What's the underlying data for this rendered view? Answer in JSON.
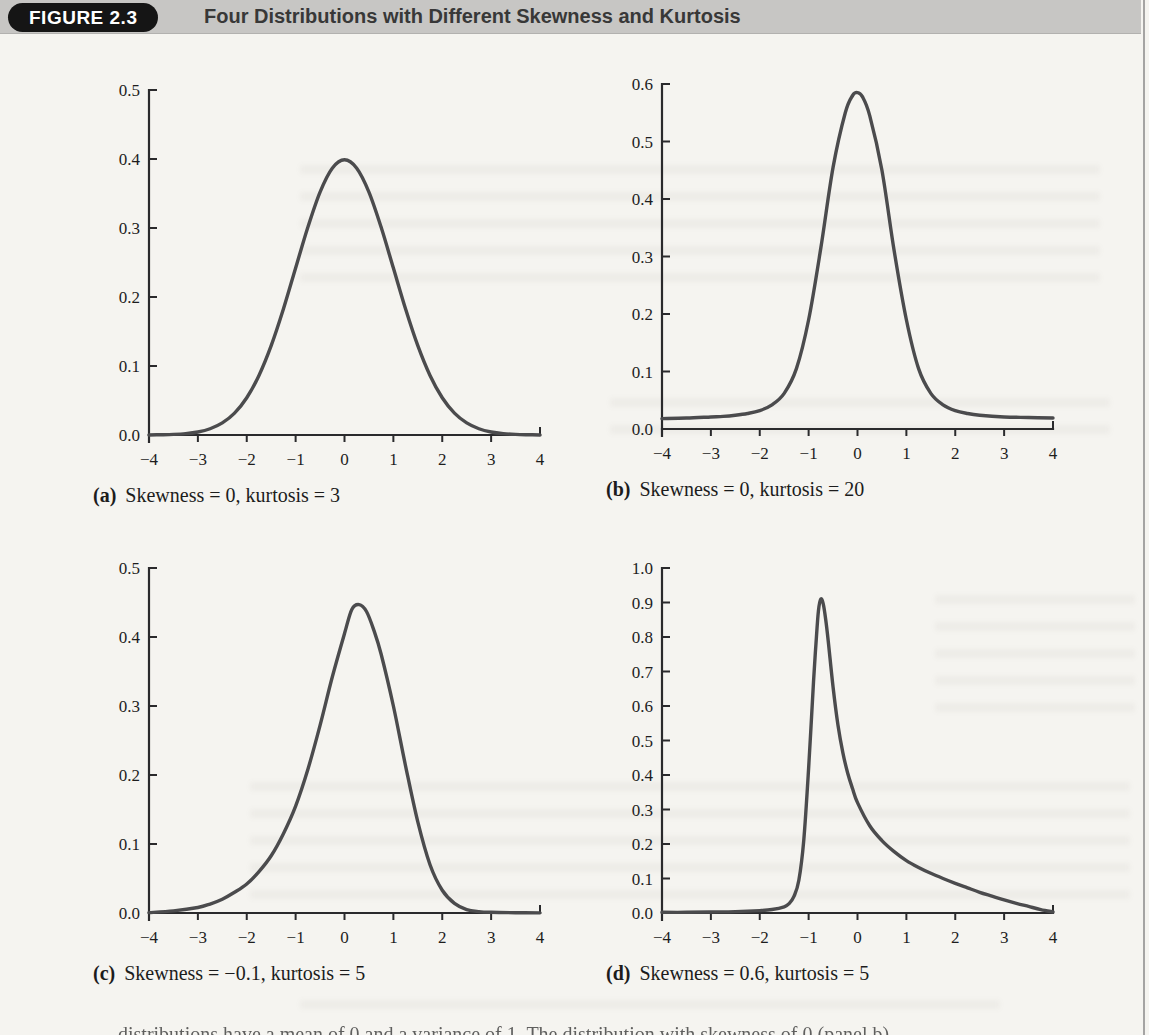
{
  "page": {
    "background": "#f5f4f0"
  },
  "header": {
    "badge": "FIGURE 2.3",
    "title": "Four Distributions with Different Skewness and Kurtosis",
    "bar_color": "#c7c6c4",
    "badge_bg": "#151515",
    "badge_text_color": "#ffffff",
    "title_color": "#383838"
  },
  "axis_color": "#2a2a2c",
  "chart_data": [
    {
      "panel": "a",
      "type": "line",
      "caption_label": "(a)",
      "caption_text": "Skewness = 0, kurtosis = 3",
      "xlim": [
        -4,
        4
      ],
      "ylim": [
        0,
        0.5
      ],
      "grid": false,
      "legend": "none",
      "curve_color": "#4b4b4d",
      "xticks": [
        {
          "v": -4,
          "label": "−4"
        },
        {
          "v": -3,
          "label": "−3"
        },
        {
          "v": -2,
          "label": "−2"
        },
        {
          "v": -1,
          "label": "−1"
        },
        {
          "v": 0,
          "label": "0"
        },
        {
          "v": 1,
          "label": "1"
        },
        {
          "v": 2,
          "label": "2"
        },
        {
          "v": 3,
          "label": "3"
        },
        {
          "v": 4,
          "label": "4"
        }
      ],
      "yticks": [
        {
          "v": 0,
          "label": "0.0"
        },
        {
          "v": 0.1,
          "label": "0.1"
        },
        {
          "v": 0.2,
          "label": "0.2"
        },
        {
          "v": 0.3,
          "label": "0.3"
        },
        {
          "v": 0.4,
          "label": "0.4"
        },
        {
          "v": 0.5,
          "label": "0.5"
        }
      ],
      "points": [
        [
          -4,
          0.0001
        ],
        [
          -3.75,
          0.0004
        ],
        [
          -3.5,
          0.0009
        ],
        [
          -3.25,
          0.002
        ],
        [
          -3,
          0.0044
        ],
        [
          -2.75,
          0.0091
        ],
        [
          -2.5,
          0.0175
        ],
        [
          -2.25,
          0.0317
        ],
        [
          -2,
          0.054
        ],
        [
          -1.75,
          0.0863
        ],
        [
          -1.5,
          0.1295
        ],
        [
          -1.25,
          0.1826
        ],
        [
          -1,
          0.242
        ],
        [
          -0.75,
          0.3011
        ],
        [
          -0.5,
          0.3521
        ],
        [
          -0.25,
          0.3867
        ],
        [
          0,
          0.3989
        ],
        [
          0.25,
          0.3867
        ],
        [
          0.5,
          0.3521
        ],
        [
          0.75,
          0.3011
        ],
        [
          1,
          0.242
        ],
        [
          1.25,
          0.1826
        ],
        [
          1.5,
          0.1295
        ],
        [
          1.75,
          0.0863
        ],
        [
          2,
          0.054
        ],
        [
          2.25,
          0.0317
        ],
        [
          2.5,
          0.0175
        ],
        [
          2.75,
          0.0091
        ],
        [
          3,
          0.0044
        ],
        [
          3.25,
          0.002
        ],
        [
          3.5,
          0.0009
        ],
        [
          3.75,
          0.0004
        ],
        [
          4,
          0.0001
        ]
      ]
    },
    {
      "panel": "b",
      "type": "line",
      "caption_label": "(b)",
      "caption_text": "Skewness = 0, kurtosis = 20",
      "xlim": [
        -4,
        4
      ],
      "ylim": [
        0,
        0.6
      ],
      "grid": false,
      "legend": "none",
      "curve_color": "#4b4b4d",
      "xticks": [
        {
          "v": -4,
          "label": "−4"
        },
        {
          "v": -3,
          "label": "−3"
        },
        {
          "v": -2,
          "label": "−2"
        },
        {
          "v": -1,
          "label": "−1"
        },
        {
          "v": 0,
          "label": "0"
        },
        {
          "v": 1,
          "label": "1"
        },
        {
          "v": 2,
          "label": "2"
        },
        {
          "v": 3,
          "label": "3"
        },
        {
          "v": 4,
          "label": "4"
        }
      ],
      "yticks": [
        {
          "v": 0,
          "label": "0.0"
        },
        {
          "v": 0.1,
          "label": "0.1"
        },
        {
          "v": 0.2,
          "label": "0.2"
        },
        {
          "v": 0.3,
          "label": "0.3"
        },
        {
          "v": 0.4,
          "label": "0.4"
        },
        {
          "v": 0.5,
          "label": "0.5"
        },
        {
          "v": 0.6,
          "label": "0.6"
        }
      ],
      "points": [
        [
          -4,
          0.018
        ],
        [
          -3.5,
          0.019
        ],
        [
          -3,
          0.021
        ],
        [
          -2.75,
          0.022
        ],
        [
          -2.5,
          0.024
        ],
        [
          -2.25,
          0.027
        ],
        [
          -2,
          0.032
        ],
        [
          -1.75,
          0.042
        ],
        [
          -1.5,
          0.062
        ],
        [
          -1.25,
          0.105
        ],
        [
          -1,
          0.19
        ],
        [
          -0.75,
          0.315
        ],
        [
          -0.5,
          0.455
        ],
        [
          -0.25,
          0.55
        ],
        [
          -0.1,
          0.58
        ],
        [
          0,
          0.585
        ],
        [
          0.1,
          0.578
        ],
        [
          0.25,
          0.545
        ],
        [
          0.5,
          0.45
        ],
        [
          0.75,
          0.31
        ],
        [
          1,
          0.19
        ],
        [
          1.25,
          0.105
        ],
        [
          1.5,
          0.062
        ],
        [
          1.75,
          0.042
        ],
        [
          2,
          0.032
        ],
        [
          2.25,
          0.027
        ],
        [
          2.5,
          0.024
        ],
        [
          3,
          0.021
        ],
        [
          3.5,
          0.02
        ],
        [
          4,
          0.019
        ]
      ]
    },
    {
      "panel": "c",
      "type": "line",
      "caption_label": "(c)",
      "caption_text": "Skewness = −0.1, kurtosis = 5",
      "xlim": [
        -4,
        4
      ],
      "ylim": [
        0,
        0.5
      ],
      "grid": false,
      "legend": "none",
      "curve_color": "#4b4b4d",
      "xticks": [
        {
          "v": -4,
          "label": "−4"
        },
        {
          "v": -3,
          "label": "−3"
        },
        {
          "v": -2,
          "label": "−2"
        },
        {
          "v": -1,
          "label": "−1"
        },
        {
          "v": 0,
          "label": "0"
        },
        {
          "v": 1,
          "label": "1"
        },
        {
          "v": 2,
          "label": "2"
        },
        {
          "v": 3,
          "label": "3"
        },
        {
          "v": 4,
          "label": "4"
        }
      ],
      "yticks": [
        {
          "v": 0,
          "label": "0.0"
        },
        {
          "v": 0.1,
          "label": "0.1"
        },
        {
          "v": 0.2,
          "label": "0.2"
        },
        {
          "v": 0.3,
          "label": "0.3"
        },
        {
          "v": 0.4,
          "label": "0.4"
        },
        {
          "v": 0.5,
          "label": "0.5"
        }
      ],
      "points": [
        [
          -4,
          0.0005
        ],
        [
          -3.5,
          0.003
        ],
        [
          -3,
          0.008
        ],
        [
          -2.75,
          0.013
        ],
        [
          -2.5,
          0.02
        ],
        [
          -2.25,
          0.03
        ],
        [
          -2,
          0.042
        ],
        [
          -1.75,
          0.06
        ],
        [
          -1.5,
          0.083
        ],
        [
          -1.25,
          0.115
        ],
        [
          -1,
          0.155
        ],
        [
          -0.75,
          0.208
        ],
        [
          -0.5,
          0.272
        ],
        [
          -0.25,
          0.342
        ],
        [
          0,
          0.405
        ],
        [
          0.15,
          0.44
        ],
        [
          0.3,
          0.447
        ],
        [
          0.45,
          0.437
        ],
        [
          0.6,
          0.41
        ],
        [
          0.75,
          0.375
        ],
        [
          1,
          0.3
        ],
        [
          1.25,
          0.213
        ],
        [
          1.5,
          0.132
        ],
        [
          1.75,
          0.07
        ],
        [
          2,
          0.033
        ],
        [
          2.25,
          0.014
        ],
        [
          2.5,
          0.005
        ],
        [
          2.75,
          0.002
        ],
        [
          3,
          0.001
        ],
        [
          3.5,
          0.0004
        ],
        [
          4,
          0.0002
        ]
      ]
    },
    {
      "panel": "d",
      "type": "line",
      "caption_label": "(d)",
      "caption_text": "Skewness = 0.6, kurtosis = 5",
      "xlim": [
        -4,
        4
      ],
      "ylim": [
        0,
        1.0
      ],
      "grid": false,
      "legend": "none",
      "curve_color": "#4b4b4d",
      "xticks": [
        {
          "v": -4,
          "label": "−4"
        },
        {
          "v": -3,
          "label": "−3"
        },
        {
          "v": -2,
          "label": "−2"
        },
        {
          "v": -1,
          "label": "−1"
        },
        {
          "v": 0,
          "label": "0"
        },
        {
          "v": 1,
          "label": "1"
        },
        {
          "v": 2,
          "label": "2"
        },
        {
          "v": 3,
          "label": "3"
        },
        {
          "v": 4,
          "label": "4"
        }
      ],
      "yticks": [
        {
          "v": 0,
          "label": "0.0"
        },
        {
          "v": 0.1,
          "label": "0.1"
        },
        {
          "v": 0.2,
          "label": "0.2"
        },
        {
          "v": 0.3,
          "label": "0.3"
        },
        {
          "v": 0.4,
          "label": "0.4"
        },
        {
          "v": 0.5,
          "label": "0.5"
        },
        {
          "v": 0.6,
          "label": "0.6"
        },
        {
          "v": 0.7,
          "label": "0.7"
        },
        {
          "v": 0.8,
          "label": "0.8"
        },
        {
          "v": 0.9,
          "label": "0.9"
        },
        {
          "v": 1.0,
          "label": "1.0"
        }
      ],
      "points": [
        [
          -4,
          0.002
        ],
        [
          -3.5,
          0.002
        ],
        [
          -3,
          0.003
        ],
        [
          -2.5,
          0.004
        ],
        [
          -2,
          0.007
        ],
        [
          -1.75,
          0.01
        ],
        [
          -1.5,
          0.018
        ],
        [
          -1.4,
          0.027
        ],
        [
          -1.3,
          0.048
        ],
        [
          -1.2,
          0.095
        ],
        [
          -1.1,
          0.21
        ],
        [
          -1,
          0.42
        ],
        [
          -0.9,
          0.67
        ],
        [
          -0.85,
          0.78
        ],
        [
          -0.8,
          0.875
        ],
        [
          -0.75,
          0.91
        ],
        [
          -0.7,
          0.895
        ],
        [
          -0.65,
          0.85
        ],
        [
          -0.6,
          0.79
        ],
        [
          -0.5,
          0.655
        ],
        [
          -0.4,
          0.545
        ],
        [
          -0.3,
          0.465
        ],
        [
          -0.2,
          0.405
        ],
        [
          -0.1,
          0.36
        ],
        [
          0,
          0.32
        ],
        [
          0.25,
          0.253
        ],
        [
          0.5,
          0.21
        ],
        [
          0.75,
          0.178
        ],
        [
          1,
          0.152
        ],
        [
          1.25,
          0.132
        ],
        [
          1.5,
          0.115
        ],
        [
          1.75,
          0.1
        ],
        [
          2,
          0.086
        ],
        [
          2.25,
          0.073
        ],
        [
          2.5,
          0.06
        ],
        [
          2.75,
          0.049
        ],
        [
          3,
          0.038
        ],
        [
          3.25,
          0.028
        ],
        [
          3.5,
          0.019
        ],
        [
          3.75,
          0.01
        ],
        [
          4,
          0.003
        ]
      ]
    }
  ],
  "footer": {
    "clipped_text": "distributions have a mean of 0 and a variance of 1. The distribution with skewness of 0 (panel b)"
  }
}
